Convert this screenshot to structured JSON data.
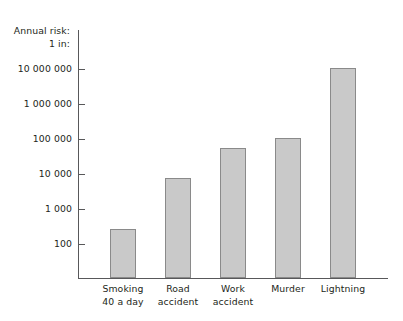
{
  "chart_data": {
    "type": "bar",
    "title": "",
    "ylabel": "Annual risk: 1 in:",
    "ylabel_lines": [
      "Annual risk:",
      "1 in:"
    ],
    "xlabel": "",
    "yscale": "log",
    "ylim": [
      100,
      30000000
    ],
    "grid": false,
    "legend": null,
    "categories": [
      "Smoking 40 a day",
      "Road accident",
      "Work accident",
      "Murder",
      "Lightning"
    ],
    "category_lines": [
      [
        "Smoking",
        "40 a day"
      ],
      [
        "Road",
        "accident"
      ],
      [
        "Work",
        "accident"
      ],
      [
        "Murder",
        ""
      ],
      [
        "Lightning",
        ""
      ]
    ],
    "values": [
      260,
      7600,
      55000,
      110000,
      11000000
    ],
    "ticks": [
      100,
      1000,
      10000,
      100000,
      1000000,
      10000000
    ],
    "tick_labels": [
      "100",
      "1 000",
      "10 000",
      "100 000",
      "1 000 000",
      "10 000 000"
    ],
    "colors": {
      "bar_fill": "#c9c9c9",
      "bar_stroke": "#8a8a8a",
      "axis": "#58585a",
      "text": "#231f20",
      "background": "#ffffff"
    }
  }
}
